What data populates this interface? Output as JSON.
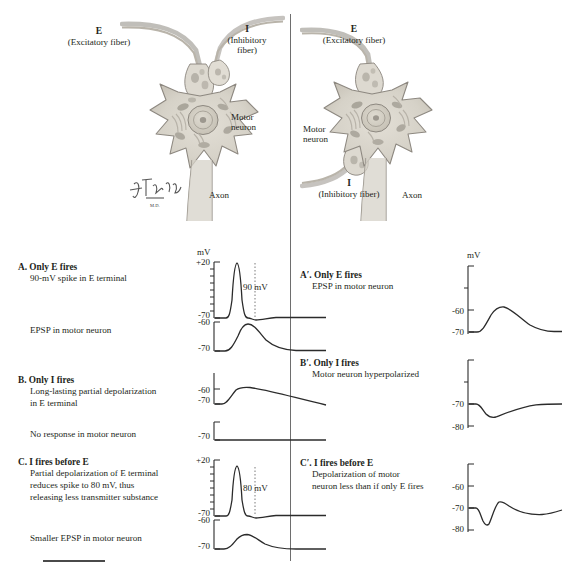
{
  "figure": {
    "title_hidden": "",
    "signature": "F. Netter"
  },
  "left_diagram": {
    "excitatory_letter": "E",
    "excitatory_caption": "(Excitatory fiber)",
    "inhibitory_letter": "I",
    "inhibitory_caption_line1": "(Inhibitory",
    "inhibitory_caption_line2": "fiber)",
    "motor_neuron_line1": "Motor",
    "motor_neuron_line2": "neuron",
    "axon_label": "Axon"
  },
  "right_diagram": {
    "excitatory_letter": "E",
    "excitatory_caption": "(Excitatory fiber)",
    "motor_neuron_line1": "Motor",
    "motor_neuron_line2": "neuron",
    "inhibitory_letter": "I",
    "inhibitory_caption": "(Inhibitory fiber)",
    "axon_label": "Axon"
  },
  "left_column": {
    "mv_unit": "mV",
    "panels": [
      {
        "id": "A",
        "heading": "A. Only E fires",
        "sub1": "90-mV spike in E terminal",
        "sub2": "EPSP in motor neuron",
        "callout": "90 mV",
        "top_trace": {
          "type": "line",
          "ylabels": [
            "+20",
            "-70"
          ],
          "ylim": [
            -70,
            20
          ],
          "baseline_mv": -70,
          "peak_mv": 20,
          "description": "action potential spike, 90 mV amplitude, with after-hyperpolarization"
        },
        "bottom_trace": {
          "type": "line",
          "ylabels": [
            "-60",
            "-70"
          ],
          "ylim": [
            -70,
            -60
          ],
          "baseline_mv": -70,
          "peak_mv": -59,
          "description": "EPSP depolarization to about -59 mV then slow decay"
        }
      },
      {
        "id": "B",
        "heading": "B. Only I fires",
        "sub1": "Long-lasting partial depolarization",
        "sub1b": "in E terminal",
        "sub2": "No response in motor neuron",
        "callout": "",
        "top_trace": {
          "type": "line",
          "ylabels": [
            "-60",
            "-70"
          ],
          "ylim": [
            -72,
            -58
          ],
          "baseline_mv": -70,
          "peak_mv": -60,
          "description": "long-lasting partial depolarization slowly decaying"
        },
        "bottom_trace": {
          "type": "line",
          "ylabels": [
            "-70"
          ],
          "ylim": [
            -75,
            -65
          ],
          "baseline_mv": -70,
          "peak_mv": -70,
          "description": "flat line, no response"
        }
      },
      {
        "id": "C",
        "heading": "C. I fires before E",
        "sub1": "Partial depolarization of E terminal",
        "sub1b": "reduces spike to 80 mV, thus",
        "sub1c": "releasing less transmitter substance",
        "sub2": "Smaller EPSP in motor neuron",
        "callout": "80 mV",
        "top_trace": {
          "type": "line",
          "ylabels": [
            "+20",
            "-70"
          ],
          "ylim": [
            -70,
            20
          ],
          "baseline_mv": -70,
          "peak_mv": 10,
          "description": "reduced action potential spike of 80 mV amplitude"
        },
        "bottom_trace": {
          "type": "line",
          "ylabels": [
            "-60",
            "-70"
          ],
          "ylim": [
            -70,
            -60
          ],
          "baseline_mv": -70,
          "peak_mv": -64,
          "description": "smaller EPSP depolarization then decay"
        }
      }
    ]
  },
  "right_column": {
    "mv_unit": "mV",
    "panels": [
      {
        "id": "A'",
        "heading": "A′. Only E fires",
        "sub1": "EPSP in motor neuron",
        "trace": {
          "type": "line",
          "ylabels": [
            "-60",
            "-70"
          ],
          "ylim": [
            -72,
            -40
          ],
          "baseline_mv": -70,
          "peak_mv": -59,
          "description": "EPSP rising to about -59 mV then decaying back to -70 mV"
        }
      },
      {
        "id": "B'",
        "heading": "B′. Only I fires",
        "sub1": "Motor neuron hyperpolarized",
        "trace": {
          "type": "line",
          "ylabels": [
            "-70",
            "-80"
          ],
          "ylim": [
            -82,
            -50
          ],
          "baseline_mv": -70,
          "trough_mv": -76,
          "description": "IPSP hyperpolarization dipping to about -76 mV then slow return"
        }
      },
      {
        "id": "C'",
        "heading": "C′. I fires before E",
        "sub1": "Depolarization of motor",
        "sub1b": "neuron less than if only E fires",
        "trace": {
          "type": "line",
          "ylabels": [
            "-60",
            "-70",
            "-80"
          ],
          "ylim": [
            -82,
            -55
          ],
          "baseline_mv": -70,
          "trough_mv": -77,
          "peak_mv": -68,
          "description": "brief hyperpolarization followed by small depolarization then return to baseline"
        }
      }
    ]
  },
  "colors": {
    "ink": "#231f20",
    "trace": "#2b2b2b",
    "divider": "#6e6e6e",
    "cell_body": "#d9d5cc",
    "cell_outline": "#8d8880",
    "nucleus": "#cfcabe",
    "organelle": "#9a958b",
    "terminal": "#e2ded6"
  }
}
